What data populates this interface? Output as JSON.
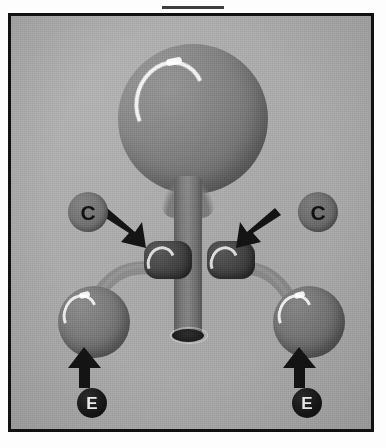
{
  "figure": {
    "caption": "",
    "frame_border_color": "#111111",
    "background_color": "#a9a9a9"
  },
  "labels": [
    {
      "id": "c-left",
      "text": "C",
      "side": "left",
      "badge_fill": "#6d6d6d",
      "text_color": "#111111",
      "points_to": "left dark lobe"
    },
    {
      "id": "c-right",
      "text": "C",
      "side": "right",
      "badge_fill": "#6d6d6d",
      "text_color": "#111111",
      "points_to": "right dark lobe"
    },
    {
      "id": "e-left",
      "text": "E",
      "side": "left",
      "badge_fill": "#111111",
      "text_color": "#f4f4f4",
      "points_to": "left lower sphere"
    },
    {
      "id": "e-right",
      "text": "E",
      "side": "right",
      "badge_fill": "#111111",
      "text_color": "#f4f4f4",
      "points_to": "right lower sphere"
    }
  ],
  "structures": [
    {
      "id": "main-bulb",
      "name": "large central bulb",
      "fill": "#7a7a7a",
      "highlight": "#ffffff"
    },
    {
      "id": "stem",
      "name": "central stem tube",
      "fill": "#7b7b7b",
      "highlight": "#ffffff"
    },
    {
      "id": "stem-opening",
      "name": "stem lumen opening",
      "fill": "#1d1d1d",
      "highlight": "#e6e6e6"
    },
    {
      "id": "lobe-left",
      "name": "left dark lobe",
      "fill": "#474747",
      "highlight": "#ffffff"
    },
    {
      "id": "lobe-right",
      "name": "right dark lobe",
      "fill": "#474747",
      "highlight": "#ffffff"
    },
    {
      "id": "lower-sphere-left",
      "name": "left lower sphere",
      "fill": "#7a7a7a",
      "highlight": "#ffffff"
    },
    {
      "id": "lower-sphere-right",
      "name": "right lower sphere",
      "fill": "#7a7a7a",
      "highlight": "#ffffff"
    },
    {
      "id": "duct-left",
      "name": "left connecting duct",
      "fill": "#888888",
      "highlight": ""
    },
    {
      "id": "duct-right",
      "name": "right connecting duct",
      "fill": "#888888",
      "highlight": ""
    }
  ],
  "arrows": [
    {
      "id": "arrow-c-left",
      "direction": "down-right",
      "color": "#141414",
      "from": "c-left",
      "to": "lobe-left"
    },
    {
      "id": "arrow-c-right",
      "direction": "down-left",
      "color": "#141414",
      "from": "c-right",
      "to": "lobe-right"
    },
    {
      "id": "arrow-e-left",
      "direction": "up",
      "color": "#141414",
      "from": "e-left",
      "to": "lower-sphere-left"
    },
    {
      "id": "arrow-e-right",
      "direction": "up",
      "color": "#141414",
      "from": "e-right",
      "to": "lower-sphere-right"
    }
  ]
}
